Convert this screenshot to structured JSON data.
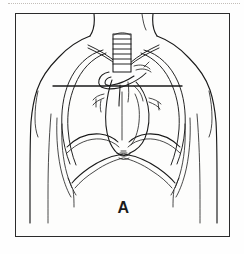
{
  "figure": {
    "kind": "anatomical-line-drawing",
    "panel_label": "A",
    "frame": {
      "style": "thin rectangle border",
      "border_color": "#2b2b2b",
      "background_color": "#fdfdfc"
    },
    "page_artifact": {
      "name": "top-dotted-rule",
      "color": "#b9b4ad"
    },
    "ink_color": "#1a1a1a",
    "parts": [
      "neck",
      "left-shoulder-contour",
      "right-shoulder-contour",
      "torso-outline",
      "clavicle-left",
      "clavicle-right",
      "trachea-with-cartilage-rings",
      "aortic-arch",
      "heart-silhouette",
      "left-lung-field",
      "right-lung-field",
      "hilar-vessels",
      "diaphragm-left-dome",
      "diaphragm-right-dome",
      "costal-margin",
      "rib-cage-lateral-margins",
      "horizontal-section-level-line"
    ]
  }
}
